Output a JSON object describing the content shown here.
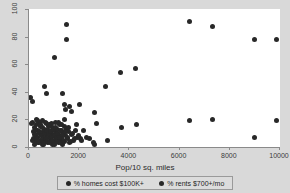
{
  "chart_data": {
    "type": "scatter",
    "title": "",
    "xlabel": "Pop/10 sq. miles",
    "ylabel": "",
    "xlim": [
      0,
      10000
    ],
    "ylim": [
      0,
      100
    ],
    "grid": false,
    "legend_position": "bottom",
    "xticks": [
      0,
      2000,
      4000,
      6000,
      8000,
      10000
    ],
    "xtick_labels": [
      "0",
      "2000",
      "4000",
      "6000",
      "8000",
      "10000"
    ],
    "yticks": [
      0,
      20,
      40,
      60,
      80,
      100
    ],
    "ytick_labels": [
      "0",
      "20",
      "40",
      "60",
      "80",
      "100"
    ],
    "series": [
      {
        "name": "% homes cost $100K+",
        "marker": "circle",
        "color": "#282828",
        "points": [
          [
            60,
            36
          ],
          [
            120,
            33
          ],
          [
            150,
            18
          ],
          [
            170,
            11
          ],
          [
            190,
            6
          ],
          [
            210,
            14
          ],
          [
            240,
            9
          ],
          [
            260,
            4
          ],
          [
            280,
            16
          ],
          [
            300,
            20
          ],
          [
            330,
            12
          ],
          [
            350,
            7
          ],
          [
            370,
            3
          ],
          [
            400,
            18
          ],
          [
            420,
            10
          ],
          [
            450,
            5
          ],
          [
            470,
            15
          ],
          [
            500,
            8
          ],
          [
            520,
            2
          ],
          [
            550,
            19
          ],
          [
            580,
            11
          ],
          [
            600,
            6
          ],
          [
            630,
            13
          ],
          [
            660,
            4
          ],
          [
            690,
            17
          ],
          [
            710,
            9
          ],
          [
            740,
            3
          ],
          [
            770,
            12
          ],
          [
            800,
            7
          ],
          [
            830,
            16
          ],
          [
            860,
            5
          ],
          [
            890,
            10
          ],
          [
            920,
            2
          ],
          [
            950,
            14
          ],
          [
            980,
            8
          ],
          [
            1010,
            4
          ],
          [
            1040,
            18
          ],
          [
            1070,
            11
          ],
          [
            1100,
            6
          ],
          [
            1130,
            13
          ],
          [
            1160,
            3
          ],
          [
            1190,
            9
          ],
          [
            1220,
            16
          ],
          [
            1250,
            5
          ],
          [
            1280,
            12
          ],
          [
            1310,
            7
          ],
          [
            1340,
            2
          ],
          [
            1370,
            10
          ],
          [
            1400,
            15
          ],
          [
            1430,
            4
          ],
          [
            1460,
            8
          ],
          [
            1500,
            13
          ],
          [
            1540,
            6
          ],
          [
            1580,
            11
          ],
          [
            1620,
            3
          ],
          [
            1700,
            9
          ],
          [
            1780,
            5
          ],
          [
            1860,
            12
          ],
          [
            1950,
            7
          ],
          [
            2050,
            6
          ],
          [
            620,
            44
          ],
          [
            700,
            39
          ],
          [
            1000,
            65
          ],
          [
            1330,
            39
          ],
          [
            1480,
            89
          ],
          [
            1500,
            78
          ],
          [
            1400,
            31
          ],
          [
            1450,
            27
          ],
          [
            1600,
            29
          ],
          [
            1700,
            26
          ],
          [
            2000,
            31
          ],
          [
            2600,
            25
          ],
          [
            3040,
            44
          ],
          [
            3660,
            54
          ],
          [
            4240,
            57
          ],
          [
            6400,
            91
          ],
          [
            7320,
            87
          ],
          [
            8980,
            78
          ],
          [
            9870,
            78
          ]
        ]
      },
      {
        "name": "% rents $700+/mo",
        "marker": "circle",
        "color": "#282828",
        "points": [
          [
            80,
            17
          ],
          [
            140,
            5
          ],
          [
            200,
            9
          ],
          [
            230,
            2
          ],
          [
            270,
            13
          ],
          [
            310,
            6
          ],
          [
            340,
            19
          ],
          [
            380,
            3
          ],
          [
            410,
            11
          ],
          [
            440,
            16
          ],
          [
            480,
            8
          ],
          [
            510,
            5
          ],
          [
            540,
            14
          ],
          [
            570,
            2
          ],
          [
            610,
            10
          ],
          [
            640,
            18
          ],
          [
            670,
            6
          ],
          [
            700,
            12
          ],
          [
            730,
            4
          ],
          [
            760,
            9
          ],
          [
            790,
            15
          ],
          [
            820,
            3
          ],
          [
            850,
            11
          ],
          [
            880,
            7
          ],
          [
            910,
            17
          ],
          [
            940,
            5
          ],
          [
            970,
            13
          ],
          [
            1000,
            2
          ],
          [
            1030,
            8
          ],
          [
            1060,
            14
          ],
          [
            1090,
            6
          ],
          [
            1120,
            10
          ],
          [
            1150,
            4
          ],
          [
            1180,
            18
          ],
          [
            1210,
            7
          ],
          [
            1240,
            12
          ],
          [
            1270,
            3
          ],
          [
            1300,
            16
          ],
          [
            1350,
            9
          ],
          [
            1390,
            5
          ],
          [
            1420,
            20
          ],
          [
            1470,
            11
          ],
          [
            1520,
            7
          ],
          [
            1570,
            14
          ],
          [
            1640,
            4
          ],
          [
            1720,
            10
          ],
          [
            1800,
            6
          ],
          [
            1880,
            16
          ],
          [
            1990,
            8
          ],
          [
            2080,
            5
          ],
          [
            2180,
            12
          ],
          [
            2280,
            7
          ],
          [
            2420,
            6
          ],
          [
            2560,
            3
          ],
          [
            2620,
            2
          ],
          [
            2680,
            17
          ],
          [
            3120,
            5
          ],
          [
            3700,
            14
          ],
          [
            4280,
            16
          ],
          [
            6400,
            19
          ],
          [
            7320,
            20
          ],
          [
            8980,
            7
          ],
          [
            9870,
            19
          ]
        ]
      }
    ]
  },
  "legend": {
    "entries": [
      {
        "label": "% homes cost $100K+"
      },
      {
        "label": "% rents $700+/mo"
      }
    ]
  }
}
